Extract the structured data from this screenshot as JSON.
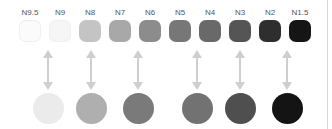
{
  "swatches": [
    {
      "label": "N9.5",
      "color": "#fbfbfb",
      "x": 30
    },
    {
      "label": "N9",
      "color": "#f6f6f6",
      "x": 60
    },
    {
      "label": "N8",
      "color": "#c4c4c4",
      "x": 90
    },
    {
      "label": "N7",
      "color": "#a8a8a8",
      "x": 120
    },
    {
      "label": "N6",
      "color": "#8c8c8c",
      "x": 150
    },
    {
      "label": "N5",
      "color": "#777777",
      "x": 180
    },
    {
      "label": "N4",
      "color": "#696969",
      "x": 210
    },
    {
      "label": "N3",
      "color": "#555555",
      "x": 240
    },
    {
      "label": "N2",
      "color": "#2e2e2e",
      "x": 270
    },
    {
      "label": "N1.5",
      "color": "#151515",
      "x": 300
    }
  ],
  "circles": [
    {
      "color": "#ebebeb",
      "x": 48
    },
    {
      "color": "#afafaf",
      "x": 91
    },
    {
      "color": "#7a7a7a",
      "x": 138
    },
    {
      "color": "#727272",
      "x": 197
    },
    {
      "color": "#4f4f4f",
      "x": 240
    },
    {
      "color": "#141414",
      "x": 287
    }
  ],
  "arrow_color": "#cfcfcf"
}
